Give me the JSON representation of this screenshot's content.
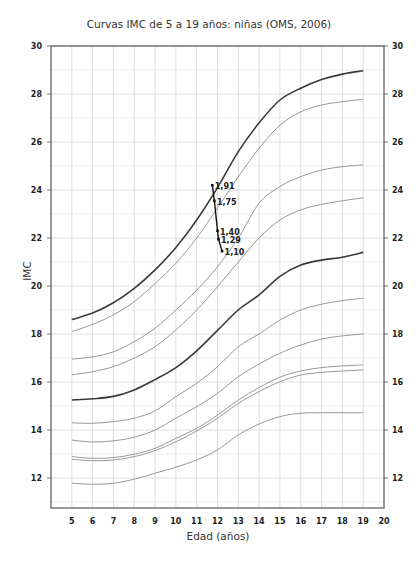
{
  "chart_data": {
    "type": "line",
    "title": "Curvas IMC de 5 a 19 años: niñas (OMS, 2006)",
    "xlabel": "Edad (años)",
    "ylabel": "IMC",
    "xlim": [
      4,
      20
    ],
    "ylim": [
      10.75,
      30
    ],
    "x_ticks": [
      5,
      6,
      7,
      8,
      9,
      10,
      11,
      12,
      13,
      14,
      15,
      16,
      17,
      18,
      19,
      20
    ],
    "y_ticks": [
      12,
      14,
      16,
      18,
      20,
      22,
      24,
      26,
      28,
      30
    ],
    "grid": true,
    "legend": "none",
    "x": [
      5,
      6,
      7,
      8,
      9,
      10,
      11,
      12,
      13,
      14,
      15,
      16,
      17,
      18,
      19
    ],
    "series": [
      {
        "name": "curve-1",
        "emphasis": "dark",
        "values": [
          18.6,
          18.87,
          19.3,
          19.9,
          20.67,
          21.6,
          22.75,
          24.1,
          25.6,
          26.8,
          27.75,
          28.24,
          28.6,
          28.83,
          28.97
        ]
      },
      {
        "name": "curve-2",
        "emphasis": "light",
        "values": [
          18.1,
          18.4,
          18.8,
          19.35,
          20.1,
          20.95,
          22.0,
          23.25,
          24.55,
          25.74,
          26.7,
          27.26,
          27.54,
          27.68,
          27.78
        ]
      },
      {
        "name": "curve-3",
        "emphasis": "light",
        "values": [
          16.95,
          17.05,
          17.26,
          17.68,
          18.24,
          19.0,
          19.83,
          20.8,
          22.0,
          23.45,
          24.14,
          24.56,
          24.83,
          24.97,
          25.05
        ]
      },
      {
        "name": "curve-4",
        "emphasis": "light",
        "values": [
          16.3,
          16.43,
          16.64,
          17.0,
          17.47,
          18.17,
          19.0,
          19.97,
          21.0,
          22.0,
          22.75,
          23.17,
          23.4,
          23.55,
          23.68
        ]
      },
      {
        "name": "curve-5",
        "emphasis": "dark",
        "values": [
          15.25,
          15.3,
          15.4,
          15.67,
          16.1,
          16.6,
          17.3,
          18.15,
          19.0,
          19.63,
          20.4,
          20.87,
          21.08,
          21.2,
          21.4
        ]
      },
      {
        "name": "curve-6",
        "emphasis": "light",
        "values": [
          14.3,
          14.28,
          14.35,
          14.49,
          14.8,
          15.39,
          15.95,
          16.64,
          17.47,
          18.0,
          18.58,
          19.0,
          19.24,
          19.39,
          19.49
        ]
      },
      {
        "name": "curve-7",
        "emphasis": "light",
        "values": [
          13.58,
          13.5,
          13.55,
          13.7,
          14.0,
          14.49,
          14.97,
          15.53,
          16.22,
          16.75,
          17.2,
          17.54,
          17.79,
          17.92,
          18.0
        ]
      },
      {
        "name": "curve-8",
        "emphasis": "light",
        "values": [
          12.89,
          12.82,
          12.85,
          12.99,
          13.24,
          13.65,
          14.07,
          14.62,
          15.25,
          15.77,
          16.2,
          16.46,
          16.6,
          16.67,
          16.71
        ]
      },
      {
        "name": "curve-9",
        "emphasis": "light",
        "values": [
          12.78,
          12.72,
          12.75,
          12.89,
          13.14,
          13.51,
          13.96,
          14.49,
          15.11,
          15.6,
          16.01,
          16.29,
          16.4,
          16.46,
          16.5
        ]
      },
      {
        "name": "curve-10",
        "emphasis": "light",
        "values": [
          11.78,
          11.74,
          11.78,
          11.95,
          12.2,
          12.45,
          12.75,
          13.17,
          13.8,
          14.25,
          14.56,
          14.7,
          14.72,
          14.72,
          14.72
        ]
      }
    ],
    "annotation": {
      "points": [
        {
          "label": "1,91",
          "x": 11.75,
          "y": 24.2
        },
        {
          "label": "1,75",
          "x": 11.85,
          "y": 23.55
        },
        {
          "label": "1,40",
          "x": 12.0,
          "y": 22.3
        },
        {
          "label": "1,29",
          "x": 12.05,
          "y": 21.95
        },
        {
          "label": "1,10",
          "x": 12.22,
          "y": 21.45
        }
      ]
    }
  }
}
